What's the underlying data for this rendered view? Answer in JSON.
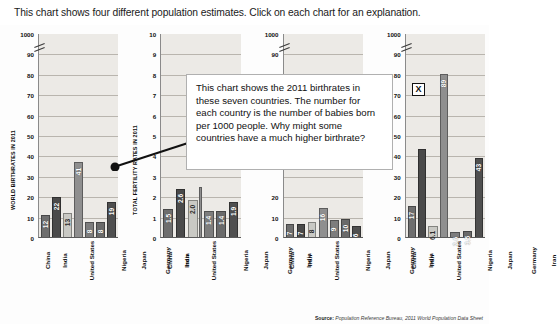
{
  "instruction": {
    "text": "This chart shows four different population estimates. Click on each chart for an explanation."
  },
  "callout": {
    "text": "This chart shows the 2011 birthrates in these seven countries. The number for each country is the number of babies born per 1000 people.  Why might some countries have a much higher birthrate?",
    "close_label": "X"
  },
  "source": {
    "prefix": "Source:",
    "text": "Population Reference Bureau, 2011 World Population Data Sheet"
  },
  "colors": {
    "plot_bg": "#eceae6",
    "grid": "#b9b5ae",
    "bar_china": "#6e6e6e",
    "bar_india": "#4a4a4a",
    "bar_united_states": "#c9c9c4",
    "bar_nigeria": "#8f8f8f",
    "bar_japan": "#7d7d7d",
    "bar_germany": "#6a6a6a",
    "bar_iran": "#4f4f4f"
  },
  "chart_data": [
    {
      "type": "bar",
      "title": "",
      "ylabel": "WORLD BIRTHRATES IN 2011",
      "xlabel": "",
      "categories": [
        "China",
        "India",
        "United States",
        "Nigeria",
        "Japan",
        "Germany",
        "Iran"
      ],
      "values": [
        12,
        22,
        13,
        41,
        8,
        8,
        19
      ],
      "value_labels": [
        "12",
        "22",
        "13",
        "41",
        "8",
        "8",
        "19"
      ],
      "yticks": [
        "1000",
        "90",
        "80",
        "70",
        "60",
        "50",
        "40",
        "30",
        "20",
        "10",
        "0"
      ],
      "ylim": [
        0,
        100
      ],
      "axis_break_at": "1000",
      "grid": true
    },
    {
      "type": "bar",
      "title": "",
      "ylabel": "TOTAL FERTILITY RATES IN 2011",
      "xlabel": "",
      "categories": [
        "China",
        "India",
        "United States",
        "Nigeria",
        "Japan",
        "Germany",
        "Iran"
      ],
      "values": [
        1.5,
        2.6,
        2.0,
        2.7,
        1.4,
        1.4,
        1.9
      ],
      "value_labels": [
        "1.5",
        "2.6",
        "2.0",
        "",
        "1.4",
        "1.4",
        "1.9"
      ],
      "yticks": [
        "10",
        "9",
        "8",
        "7",
        "6",
        "5",
        "4",
        "3",
        "2",
        "1",
        "0"
      ],
      "ylim": [
        0,
        10
      ],
      "axis_break_at": "",
      "grid": true
    },
    {
      "type": "bar",
      "title": "",
      "ylabel": "",
      "xlabel": "",
      "categories": [
        "China",
        "India",
        "United States",
        "Nigeria",
        "Japan",
        "Germany",
        "Iran"
      ],
      "values": [
        7,
        7,
        8,
        16,
        9,
        10,
        6
      ],
      "value_labels": [
        "7",
        "7",
        "8",
        "16",
        "9",
        "10",
        "6"
      ],
      "yticks": [
        "1000",
        "90",
        "",
        "",
        "",
        "",
        "",
        "",
        "20",
        "10",
        "0"
      ],
      "ylim": [
        0,
        100
      ],
      "axis_break_at": "1000",
      "grid": true
    },
    {
      "type": "bar",
      "title": "",
      "ylabel": "",
      "xlabel": "",
      "categories": [
        "China",
        "India",
        "United States",
        "Nigeria",
        "Japan",
        "Germany",
        "Iran"
      ],
      "values": [
        17,
        48,
        6.1,
        89,
        2.6,
        3.5,
        43
      ],
      "value_labels": [
        "17",
        "",
        "6.1",
        "89",
        "2.6",
        "3.5",
        "43"
      ],
      "yticks": [
        "1000",
        "90",
        "80",
        "70",
        "60",
        "50",
        "40",
        "30",
        "20",
        "10",
        "0"
      ],
      "ylim": [
        0,
        100
      ],
      "axis_break_at": "1000",
      "grid": true
    }
  ]
}
